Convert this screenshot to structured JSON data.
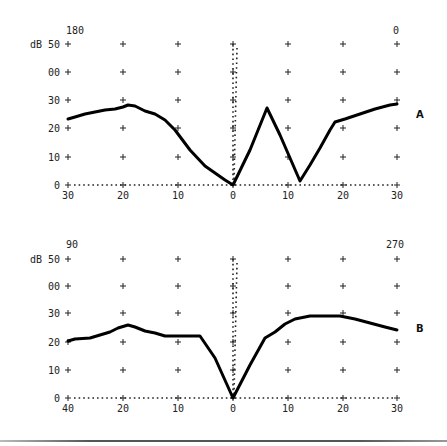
{
  "chart_data": [
    {
      "id": "A",
      "type": "line",
      "title": "",
      "panel_label": "A",
      "ylabel": "dB",
      "ylim": [
        0,
        50
      ],
      "y_tick_labels": [
        "50",
        "00",
        "30",
        "20",
        "10",
        "0"
      ],
      "x_tick_labels": [
        "30",
        "20",
        "10",
        "0",
        "10",
        "20",
        "30"
      ],
      "x_positions_deg": [
        -30,
        -20,
        -10,
        0,
        10,
        20,
        30
      ],
      "corner_labels": {
        "left": "180",
        "right": "0"
      },
      "grid": "plus-markers",
      "series": [
        {
          "name": "A",
          "x": [
            -30,
            -28,
            -25,
            -20,
            -19,
            -15,
            -10,
            -5,
            -3,
            0,
            3,
            6,
            8,
            12,
            15,
            18,
            20,
            25,
            30
          ],
          "y": [
            23.5,
            24.5,
            26,
            27.5,
            28.5,
            26,
            19,
            7.5,
            4,
            0,
            12,
            27.5,
            18,
            1.5,
            12,
            22,
            23.5,
            26,
            28.7
          ]
        }
      ]
    },
    {
      "id": "B",
      "type": "line",
      "title": "",
      "panel_label": "B",
      "ylabel": "dB",
      "ylim": [
        0,
        50
      ],
      "y_tick_labels": [
        "50",
        "00",
        "30",
        "20",
        "10",
        "0"
      ],
      "x_tick_labels": [
        "40",
        "20",
        "10",
        "0",
        "10",
        "20",
        "30"
      ],
      "x_positions_deg": [
        -40,
        -20,
        -10,
        0,
        10,
        20,
        30
      ],
      "corner_labels": {
        "left": "90",
        "right": "270"
      },
      "grid": "plus-markers",
      "series": [
        {
          "name": "B",
          "x": [
            -40,
            -35,
            -28,
            -20,
            -18,
            -15,
            -12,
            -6,
            -3,
            0,
            3,
            6,
            10,
            14,
            20,
            22,
            25,
            28,
            30
          ],
          "y": [
            20.5,
            21.5,
            23,
            26.5,
            27.5,
            25,
            22.5,
            22.5,
            14.5,
            0,
            12,
            21.5,
            26,
            29,
            29,
            28,
            27,
            25.5,
            24.5
          ]
        }
      ]
    }
  ],
  "layout": {
    "columns_px": [
      68,
      123,
      178,
      233,
      288,
      343,
      397
    ],
    "panelA": {
      "rows_px": [
        44,
        72,
        100,
        128,
        157,
        185
      ],
      "curve_px": [
        [
          68,
          119
        ],
        [
          75,
          117
        ],
        [
          85,
          114
        ],
        [
          95,
          112
        ],
        [
          105,
          110
        ],
        [
          115,
          109
        ],
        [
          123,
          107
        ],
        [
          128,
          105
        ],
        [
          135,
          106
        ],
        [
          145,
          111
        ],
        [
          155,
          114
        ],
        [
          165,
          120
        ],
        [
          175,
          130
        ],
        [
          190,
          150
        ],
        [
          205,
          166
        ],
        [
          215,
          173
        ],
        [
          225,
          180
        ],
        [
          233,
          185
        ],
        [
          250,
          150
        ],
        [
          267,
          108
        ],
        [
          280,
          135
        ],
        [
          300,
          181
        ],
        [
          310,
          165
        ],
        [
          320,
          148
        ],
        [
          330,
          130
        ],
        [
          335,
          122
        ],
        [
          345,
          119
        ],
        [
          360,
          114
        ],
        [
          375,
          109
        ],
        [
          390,
          105
        ],
        [
          397,
          104
        ]
      ],
      "letter_pos": [
        416,
        118
      ],
      "corner_left_pos": [
        66,
        34
      ],
      "corner_right_pos": [
        393,
        34
      ]
    },
    "panelB": {
      "rows_px": [
        259,
        286,
        313,
        342,
        370,
        398
      ],
      "curve_px": [
        [
          68,
          341
        ],
        [
          75,
          339
        ],
        [
          90,
          338
        ],
        [
          100,
          335
        ],
        [
          110,
          332
        ],
        [
          118,
          328
        ],
        [
          128,
          325
        ],
        [
          135,
          327
        ],
        [
          145,
          331
        ],
        [
          155,
          333
        ],
        [
          165,
          336
        ],
        [
          200,
          336
        ],
        [
          215,
          358
        ],
        [
          233,
          398
        ],
        [
          250,
          365
        ],
        [
          265,
          338
        ],
        [
          275,
          332
        ],
        [
          285,
          324
        ],
        [
          295,
          319
        ],
        [
          310,
          316
        ],
        [
          340,
          316
        ],
        [
          355,
          319
        ],
        [
          370,
          323
        ],
        [
          385,
          327
        ],
        [
          397,
          330
        ]
      ],
      "letter_pos": [
        416,
        332
      ],
      "corner_left_pos": [
        66,
        248
      ],
      "corner_right_pos": [
        386,
        248
      ]
    }
  }
}
